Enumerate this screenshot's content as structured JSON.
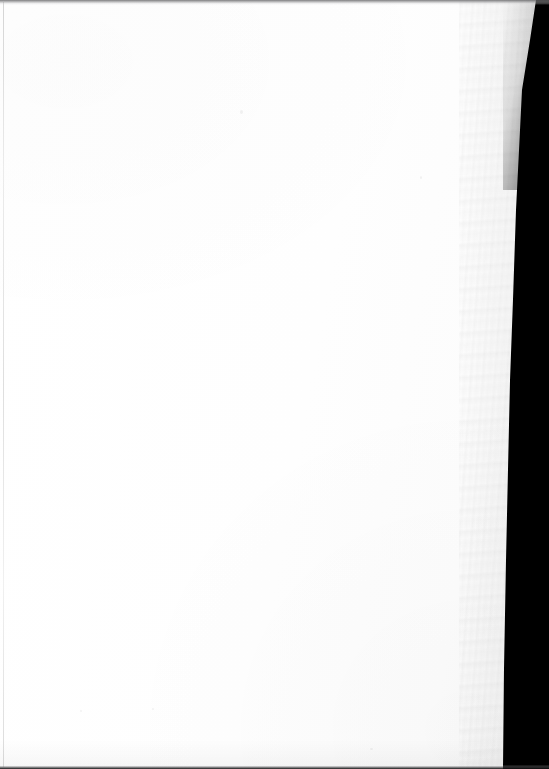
{
  "document": {
    "kind": "scanned-page-image",
    "page_condition": "blank",
    "visible_text": "",
    "visible_text_lines": [],
    "text_block_count": 0,
    "page_number_label": "",
    "header_text": "",
    "footer_text": "",
    "marginalia": ""
  },
  "scan": {
    "frame_width_px": 549,
    "frame_height_px": 769,
    "background_color": "#000000",
    "page_color": "#fdfdfd",
    "page_shadow_color": "#5a5a5c"
  },
  "page_edge": {
    "side": "right",
    "description": "rough deckled paper edge",
    "top_x_px": 536,
    "bottom_x_px": 503,
    "profile": [
      {
        "y": 0,
        "x": 536
      },
      {
        "y": 40,
        "x": 530
      },
      {
        "y": 90,
        "x": 522
      },
      {
        "y": 150,
        "x": 519
      },
      {
        "y": 210,
        "x": 516
      },
      {
        "y": 300,
        "x": 513
      },
      {
        "y": 380,
        "x": 510
      },
      {
        "y": 470,
        "x": 508
      },
      {
        "y": 560,
        "x": 506
      },
      {
        "y": 670,
        "x": 504
      },
      {
        "y": 769,
        "x": 503
      }
    ]
  },
  "artifacts": {
    "top_strip": {
      "name": "scanner-edge-strip-top",
      "height_px": 5,
      "color": "#606062"
    },
    "bottom_strip": {
      "name": "scanner-edge-strip-bottom",
      "height_px": 4,
      "color": "#0c0c0c"
    },
    "left_rule": {
      "name": "left-margin-rule",
      "x_px": 3,
      "color": "#000000",
      "opacity": 0.14
    },
    "speck_count": 5
  },
  "chart_data": null
}
